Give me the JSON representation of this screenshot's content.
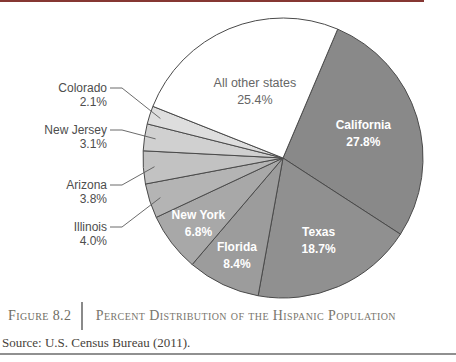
{
  "page": {
    "top_rule_color": "#863733",
    "background": "#ffffff"
  },
  "figure_caption": {
    "label": "Figure 8.2",
    "title": "Percent Distribution of the Hispanic Population",
    "source": "Source: U.S. Census Bureau (2011)."
  },
  "chart_data": {
    "type": "pie",
    "title": "Percent Distribution of the Hispanic Population",
    "unit": "%",
    "start_angle_deg": 23,
    "direction": "clockwise",
    "legend": "none",
    "outline_color": "#4a4a4a",
    "slices": [
      {
        "label": "California",
        "value": 27.8,
        "color": "#898989",
        "text_color": "#ffffff",
        "bold": true,
        "label_pos": "inside"
      },
      {
        "label": "Texas",
        "value": 18.7,
        "color": "#909090",
        "text_color": "#ffffff",
        "bold": true,
        "label_pos": "inside"
      },
      {
        "label": "Florida",
        "value": 8.4,
        "color": "#9c9c9c",
        "text_color": "#ffffff",
        "bold": true,
        "label_pos": "inside"
      },
      {
        "label": "New York",
        "value": 6.8,
        "color": "#a8a8a8",
        "text_color": "#ffffff",
        "bold": true,
        "label_pos": "inside"
      },
      {
        "label": "Illinois",
        "value": 4.0,
        "color": "#b4b4b4",
        "text_color": "#4d4d4d",
        "bold": false,
        "label_pos": "outside"
      },
      {
        "label": "Arizona",
        "value": 3.8,
        "color": "#c2c2c2",
        "text_color": "#4d4d4d",
        "bold": false,
        "label_pos": "outside"
      },
      {
        "label": "New Jersey",
        "value": 3.1,
        "color": "#d0d0d0",
        "text_color": "#4d4d4d",
        "bold": false,
        "label_pos": "outside"
      },
      {
        "label": "Colorado",
        "value": 2.1,
        "color": "#dedede",
        "text_color": "#4d4d4d",
        "bold": false,
        "label_pos": "outside"
      },
      {
        "label": "All other states",
        "value": 25.4,
        "color": "#ffffff",
        "text_color": "#666666",
        "bold": false,
        "label_pos": "inside"
      }
    ]
  }
}
